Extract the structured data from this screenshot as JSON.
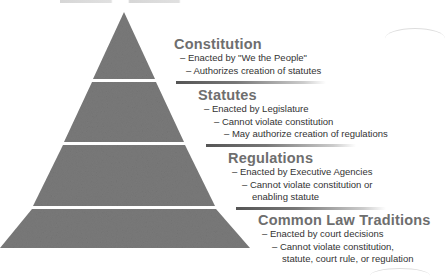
{
  "diagram": {
    "type": "pyramid",
    "colors": {
      "tier_fill": "#7a7a7a",
      "separator": "#ffffff",
      "heading": "#6e6e6e",
      "text": "#333333"
    },
    "tiers": [
      {
        "title": "Constitution",
        "bullets": [
          "– Enacted by \"We the People\"",
          "– Authorizes creation of statutes"
        ]
      },
      {
        "title": "Statutes",
        "bullets": [
          "– Enacted by Legislature",
          "– Cannot violate constitution",
          "– May authorize creation of regulations"
        ]
      },
      {
        "title": "Regulations",
        "bullets": [
          "– Enacted by Executive Agencies",
          "– Cannot violate constitution or",
          "enabling statute"
        ]
      },
      {
        "title": "Common Law Traditions",
        "bullets": [
          "– Enacted by court decisions",
          "– Cannot violate constitution,",
          "statute, court rule, or regulation"
        ]
      }
    ]
  }
}
